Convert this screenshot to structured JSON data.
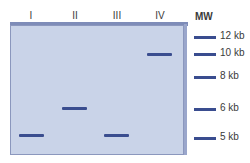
{
  "lanes": [
    {
      "label": "I",
      "band_kb": 5
    },
    {
      "label": "II",
      "band_kb": 6
    },
    {
      "label": "III",
      "band_kb": 5
    },
    {
      "label": "IV",
      "band_kb": 10
    }
  ],
  "marker": {
    "label": "MW",
    "bands": [
      "12 kb",
      "10 kb",
      "8 kb",
      "6 kb",
      "5 kb"
    ]
  },
  "colors": {
    "gel": "#c9d3e8",
    "band": "#3a4d8f"
  }
}
